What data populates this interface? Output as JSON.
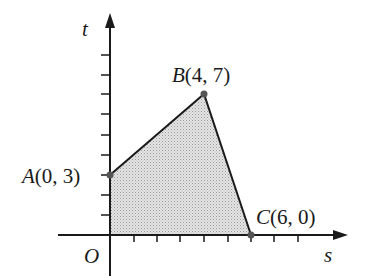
{
  "diagram": {
    "axes": {
      "horizontal_label": "s",
      "vertical_label": "t",
      "origin_label": "O"
    },
    "points": [
      {
        "name": "A",
        "coords": "(0, 3)",
        "s": 0,
        "t": 3
      },
      {
        "name": "B",
        "coords": "(4, 7)",
        "s": 4,
        "t": 7
      },
      {
        "name": "C",
        "coords": "(6, 0)",
        "s": 6,
        "t": 0
      }
    ],
    "region": {
      "vertices": [
        "O",
        "A",
        "B",
        "C"
      ],
      "fill": "shaded"
    },
    "ticks": {
      "s_count": 8,
      "t_count": 9
    },
    "colors": {
      "line": "#1a1a1a",
      "shade": "#d8d8d8",
      "point": "#555555"
    }
  }
}
